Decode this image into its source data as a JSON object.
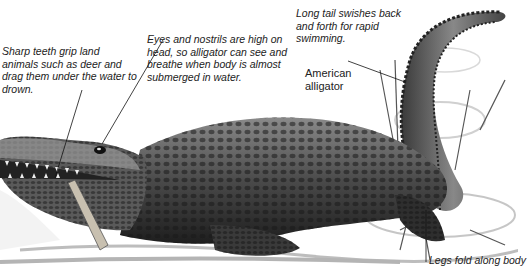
{
  "diagram": {
    "subject": "American alligator",
    "annotations": [
      {
        "id": "teeth",
        "text": "Sharp teeth grip land animals such as deer and drag them under the water to drown."
      },
      {
        "id": "eyes",
        "text": "Eyes and nostrils are high on head, so alligator can see and breathe when body is almost submerged in water."
      },
      {
        "id": "tail",
        "text": "Long tail swishes back and forth for rapid swimming."
      },
      {
        "id": "legs",
        "text": "Legs fold along body"
      }
    ],
    "species_label": "American alligator"
  }
}
